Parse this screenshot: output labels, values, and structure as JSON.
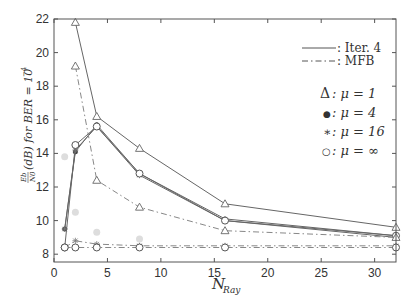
{
  "chart_data": {
    "type": "line",
    "title": "",
    "xlabel": "N_Ray",
    "xlabel_main": "N",
    "xlabel_sub": "Ray",
    "ylabel": "Eb/N0 (dB) for BER = 10^-4",
    "ylabel_parts": {
      "frac_num": "Eb",
      "frac_den": "N0",
      "text": "(dB) for BER = 10",
      "exp": "−4"
    },
    "xlim": [
      0,
      32
    ],
    "ylim": [
      7.5,
      22
    ],
    "xticks": [
      0,
      5,
      10,
      15,
      20,
      25,
      30
    ],
    "yticks": [
      8,
      10,
      12,
      14,
      16,
      18,
      20,
      22
    ],
    "grid": false,
    "legend_position": "upper right",
    "legend": {
      "line_styles": [
        {
          "style": "solid",
          "label": ": Iter. 4"
        },
        {
          "style": "dashdot",
          "label": ": MFB"
        }
      ],
      "markers": [
        {
          "marker": "triangle",
          "symbol": "Δ",
          "label": ": μ = 1"
        },
        {
          "marker": "dot",
          "symbol": "●",
          "label": ": μ = 4"
        },
        {
          "marker": "star",
          "symbol": "∗",
          "label": ": μ = 16"
        },
        {
          "marker": "circle",
          "symbol": "○",
          "label": ": μ = ∞"
        }
      ]
    },
    "x": [
      1,
      2,
      4,
      8,
      16,
      32
    ],
    "series": [
      {
        "name": "Iter. 4, μ=1",
        "style": "solid",
        "marker": "triangle",
        "x": [
          2,
          4,
          8,
          16,
          32
        ],
        "values": [
          21.8,
          16.2,
          14.3,
          11.0,
          9.6
        ]
      },
      {
        "name": "Iter. 4, μ=4",
        "style": "solid",
        "marker": "dot",
        "x": [
          1,
          2,
          4,
          8,
          16,
          32
        ],
        "values": [
          9.5,
          14.1,
          15.7,
          12.8,
          10.1,
          9.1
        ]
      },
      {
        "name": "Iter. 4, μ=16",
        "style": "solid",
        "marker": "star",
        "x": [
          1,
          2,
          4,
          8,
          16,
          32
        ],
        "values": [
          9.5,
          14.2,
          15.6,
          12.7,
          10.0,
          9.0
        ]
      },
      {
        "name": "Iter. 4, μ=∞",
        "style": "solid",
        "marker": "circle",
        "x": [
          1,
          2,
          4,
          8,
          16,
          32
        ],
        "values": [
          8.4,
          14.5,
          15.6,
          12.8,
          10.0,
          9.1
        ]
      },
      {
        "name": "MFB, μ=1",
        "style": "dashdot",
        "marker": "triangle",
        "x": [
          2,
          4,
          8,
          16,
          32
        ],
        "values": [
          19.2,
          12.4,
          10.8,
          9.4,
          9.0
        ]
      },
      {
        "name": "MFB, μ=16",
        "style": "dashdot",
        "marker": "star",
        "x": [
          1,
          2,
          4,
          8,
          16,
          32
        ],
        "values": [
          8.4,
          8.8,
          8.6,
          8.5,
          8.5,
          8.5
        ]
      },
      {
        "name": "MFB, μ=∞",
        "style": "dashdot",
        "marker": "circle",
        "x": [
          1,
          2,
          4,
          8,
          16,
          32
        ],
        "values": [
          8.4,
          8.4,
          8.4,
          8.4,
          8.4,
          8.4
        ]
      }
    ],
    "ghost_points": [
      {
        "x": 1,
        "y": 13.8
      },
      {
        "x": 2,
        "y": 10.5
      },
      {
        "x": 4,
        "y": 9.3
      },
      {
        "x": 8,
        "y": 8.9
      }
    ]
  }
}
